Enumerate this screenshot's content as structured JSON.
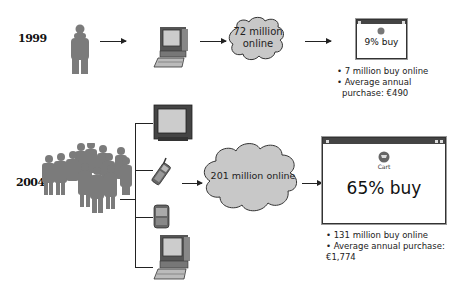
{
  "row_1999": {
    "year": "1999",
    "cloud": {
      "line1": "72 million",
      "line2": "online"
    },
    "window": {
      "icon": "cart-icon",
      "text": "9% buy"
    },
    "bullets": [
      "• 7 million buy online",
      "• Average annual",
      "  purchase: €490"
    ]
  },
  "row_2004": {
    "year": "2004",
    "devices": [
      "television-icon",
      "mobile-phone-icon",
      "pda-icon",
      "desktop-computer-icon"
    ],
    "cloud": {
      "text": "201 million online"
    },
    "window": {
      "icon_label": "Cart",
      "text": "65% buy"
    },
    "bullets": [
      "• 131 million buy online",
      "• Average annual purchase:",
      "  €1,774"
    ]
  },
  "colors": {
    "people": "#7b7b7b",
    "cloud_fill": "#c8c8c8",
    "window_bar": "#444444"
  }
}
